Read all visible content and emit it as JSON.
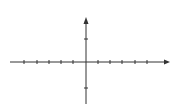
{
  "chart_data": {
    "type": "line",
    "title": "",
    "xlabel": "x",
    "ylabel": "y",
    "xlim": [
      -3,
      3
    ],
    "ylim": [
      -1.4,
      1.9
    ],
    "x_ticks": [
      "-3",
      "-2",
      "-1",
      "1",
      "2",
      "3"
    ],
    "y_ticks": [
      "1",
      "-1"
    ],
    "series": [
      {
        "name": "parametric curve",
        "description": "closed curve x in [-3,3], y in [-1,1], tips at x=±3 at y=1,0,-1, self-crossings on y-axis near y=±0.5"
      }
    ]
  },
  "labels": {
    "x": "x",
    "y": "y",
    "xt": [
      "−3",
      "−2",
      "−1",
      "1",
      "2",
      "3"
    ],
    "y1": "1",
    "ym1": "−1"
  }
}
